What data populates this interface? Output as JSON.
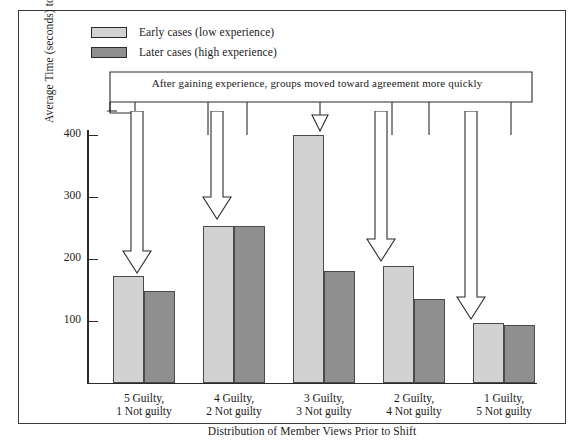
{
  "legend": {
    "items": [
      {
        "label": "Early cases (low experience)",
        "swatch": "light",
        "color": "#d2d2d2"
      },
      {
        "label": "Later cases (high experience)",
        "swatch": "dark",
        "color": "#8f8f8f"
      }
    ]
  },
  "annotation": {
    "text": "After gaining experience, groups moved toward agreement more quickly"
  },
  "chart_data": {
    "type": "bar",
    "title": "",
    "xlabel": "Distribution of Member Views Prior to Shift",
    "ylabel": "Average Time (seconds) to Shifts in Member Opinions",
    "categories": [
      "5 Guilty,\n1 Not guilty",
      "4 Guilty,\n2 Not guilty",
      "3 Guilty,\n3 Not guilty",
      "2 Guilty,\n4 Not guilty",
      "1 Guilty,\n5 Not guilty"
    ],
    "category_lines": [
      [
        "5 Guilty,",
        "1 Not guilty"
      ],
      [
        "4 Guilty,",
        "2 Not guilty"
      ],
      [
        "3 Guilty,",
        "3 Not guilty"
      ],
      [
        "2 Guilty,",
        "4 Not guilty"
      ],
      [
        "1 Guilty,",
        "5 Not guilty"
      ]
    ],
    "series": [
      {
        "name": "Early cases (low experience)",
        "color": "#d2d2d2",
        "values": [
          172,
          253,
          400,
          188,
          96
        ]
      },
      {
        "name": "Later cases (high experience)",
        "color": "#8f8f8f",
        "values": [
          148,
          252,
          180,
          134,
          93
        ]
      }
    ],
    "yticks": [
      100,
      200,
      300,
      400
    ],
    "ylim": [
      0,
      430
    ],
    "grid": false,
    "legend_position": "top-left",
    "annotations": [
      "After gaining experience, groups moved toward agreement more quickly"
    ]
  }
}
